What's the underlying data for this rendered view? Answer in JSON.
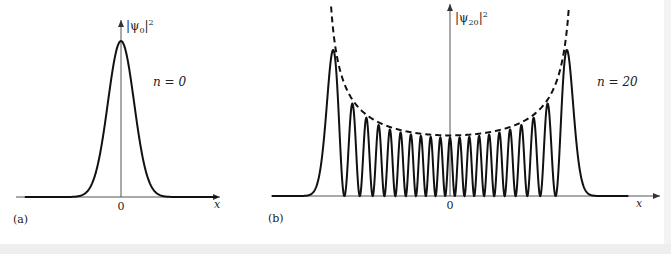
{
  "chart_data": [
    {
      "type": "line",
      "panel_label": "(a)",
      "title": "",
      "xlabel": "x",
      "ylabel": "|ψ0|²",
      "ylabel_parts": {
        "base": "|ψ",
        "sub": "0",
        "tail": "|",
        "sup": "2"
      },
      "annotation": "n = 0",
      "x_tick_labels": [
        "0"
      ],
      "n": 0,
      "xlim": [
        -5.5,
        5.5
      ],
      "ylim": [
        0,
        1.1
      ],
      "grid": false,
      "series": [
        {
          "name": "|ψ0|²",
          "style": "solid",
          "function": "exp(-x^2)",
          "peak_x": 0,
          "peak_y": 1.0
        }
      ]
    },
    {
      "type": "line",
      "panel_label": "(b)",
      "title": "",
      "xlabel": "x",
      "ylabel": "|ψ20|²",
      "ylabel_parts": {
        "base": "|ψ",
        "sub": "20",
        "tail": "|",
        "sup": "2"
      },
      "annotation": "n = 20",
      "x_tick_labels": [
        "0"
      ],
      "n": 20,
      "xlim": [
        -8.5,
        8.5
      ],
      "ylim": [
        0,
        1.1
      ],
      "grid": false,
      "series": [
        {
          "name": "|ψ20|² quantum probability density",
          "style": "solid",
          "maxima_count": 21,
          "zeros_count": 20
        },
        {
          "name": "classical probability density",
          "style": "dashed",
          "function": "1/(π·sqrt(2n+1-x^2))",
          "turning_points": [
            -6.403,
            6.403
          ]
        }
      ]
    }
  ]
}
